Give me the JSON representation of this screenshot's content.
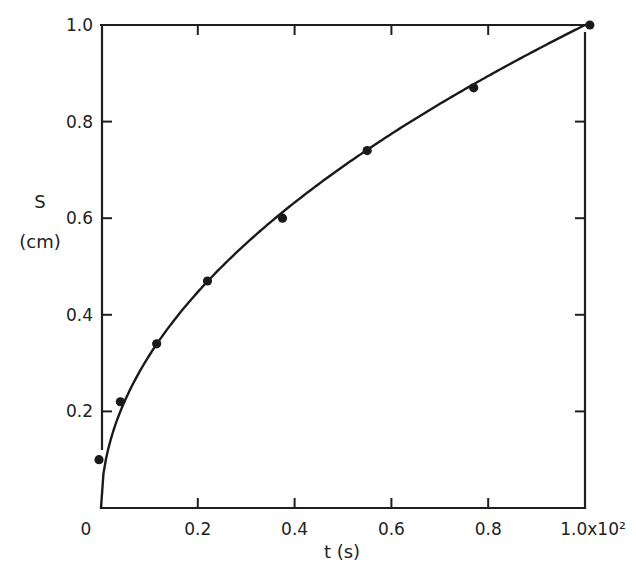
{
  "chart_data": {
    "type": "scatter",
    "title": "",
    "xlabel": "t (s)",
    "ylabel": "S",
    "ylabel_unit": "(cm)",
    "xlim": [
      0,
      1.0
    ],
    "ylim": [
      0,
      1.0
    ],
    "x_scale_note": "x10^2",
    "grid": false,
    "legend": null,
    "x_ticks": [
      0.2,
      0.4,
      0.6,
      0.8,
      1.0
    ],
    "x_tick_labels": [
      "0.2",
      "0.4",
      "0.6",
      "0.8",
      "1.0x10²"
    ],
    "y_ticks": [
      0,
      0.2,
      0.4,
      0.6,
      0.8,
      1.0
    ],
    "y_tick_labels": [
      "0",
      "0.2",
      "0.4",
      "0.6",
      "0.8",
      "1.0"
    ],
    "series": [
      {
        "name": "measured",
        "kind": "points",
        "x": [
          0.0,
          0.04,
          0.115,
          0.22,
          0.375,
          0.55,
          0.77,
          1.01
        ],
        "y": [
          0.1,
          0.22,
          0.34,
          0.47,
          0.6,
          0.74,
          0.87,
          1.0
        ]
      },
      {
        "name": "fit",
        "kind": "curve",
        "formula": "S = sqrt(t)"
      }
    ]
  },
  "axes": {
    "x_label": "t (s)",
    "y_label_main": "S",
    "y_label_unit": "(cm)",
    "origin_label": "0"
  }
}
